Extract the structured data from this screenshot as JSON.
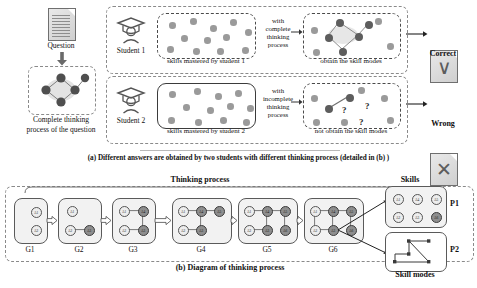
{
  "figure": {
    "caption_a": "(a) Different answers are obtained by two students with different thinking process (detailed in (b) )",
    "caption_b": "(b) Diagram of thinking process"
  },
  "panel_a": {
    "question_label": "Question",
    "question_icon": "document-icon",
    "arrow_icon": "down-arrow-icon",
    "complete_process_label_line1": "Complete thinking",
    "complete_process_label_line2": "process of the question",
    "rows": [
      {
        "student_label": "Student 1",
        "student_icon": "graduate-student-icon",
        "skills_label": "skills mastered by student 1",
        "connector_line1": "with",
        "connector_line2": "complete",
        "connector_line3": "thinking",
        "connector_line4": "process",
        "modes_label": "obtain the skill modes",
        "result_label": "Correct",
        "result_icon": "check-document-icon",
        "skill_dots": [
          {
            "x": 12,
            "y": 9,
            "state": "light"
          },
          {
            "x": 33,
            "y": 5,
            "state": "light"
          },
          {
            "x": 53,
            "y": 12,
            "state": "light"
          },
          {
            "x": 73,
            "y": 6,
            "state": "light"
          },
          {
            "x": 88,
            "y": 16,
            "state": "light"
          },
          {
            "x": 24,
            "y": 22,
            "state": "light"
          },
          {
            "x": 47,
            "y": 24,
            "state": "light"
          },
          {
            "x": 66,
            "y": 21,
            "state": "light"
          },
          {
            "x": 10,
            "y": 33,
            "state": "light"
          },
          {
            "x": 36,
            "y": 35,
            "state": "light"
          },
          {
            "x": 60,
            "y": 35,
            "state": "light"
          },
          {
            "x": 85,
            "y": 34,
            "state": "light"
          }
        ],
        "mode_dots": [
          {
            "x": 8,
            "y": 14,
            "state": "light"
          },
          {
            "x": 72,
            "y": 5,
            "state": "light"
          },
          {
            "x": 84,
            "y": 30,
            "state": "light"
          },
          {
            "x": 10,
            "y": 36,
            "state": "light"
          },
          {
            "x": 33,
            "y": 6,
            "state": "dark"
          },
          {
            "x": 22,
            "y": 21,
            "state": "dark"
          },
          {
            "x": 52,
            "y": 20,
            "state": "dark"
          },
          {
            "x": 36,
            "y": 35,
            "state": "dark"
          },
          {
            "x": 62,
            "y": 8,
            "state": "dark"
          }
        ]
      },
      {
        "student_label": "Student 2",
        "student_icon": "graduate-student-icon",
        "skills_label": "skills mastered by student 2",
        "connector_line1": "with",
        "connector_line2": "incomplete",
        "connector_line3": "thinking",
        "connector_line4": "process",
        "modes_label": "not obtain the skill modes",
        "result_label": "Wrong",
        "result_icon": "cross-document-icon",
        "skill_dots": [
          {
            "x": 12,
            "y": 8,
            "state": "light"
          },
          {
            "x": 37,
            "y": 5,
            "state": "light"
          },
          {
            "x": 58,
            "y": 10,
            "state": "light"
          },
          {
            "x": 78,
            "y": 7,
            "state": "light"
          },
          {
            "x": 90,
            "y": 22,
            "state": "light"
          },
          {
            "x": 26,
            "y": 21,
            "state": "light"
          },
          {
            "x": 50,
            "y": 24,
            "state": "light"
          },
          {
            "x": 70,
            "y": 20,
            "state": "light"
          },
          {
            "x": 11,
            "y": 34,
            "state": "light"
          },
          {
            "x": 38,
            "y": 36,
            "state": "light"
          },
          {
            "x": 63,
            "y": 34,
            "state": "light"
          },
          {
            "x": 86,
            "y": 36,
            "state": "light"
          }
        ],
        "mode_dots": [
          {
            "x": 8,
            "y": 12,
            "state": "light"
          },
          {
            "x": 55,
            "y": 4,
            "state": "light"
          },
          {
            "x": 78,
            "y": 12,
            "state": "light"
          },
          {
            "x": 10,
            "y": 36,
            "state": "light"
          },
          {
            "x": 38,
            "y": 36,
            "state": "light"
          },
          {
            "x": 84,
            "y": 34,
            "state": "light"
          },
          {
            "x": 22,
            "y": 22,
            "state": "dark"
          },
          {
            "x": 43,
            "y": 11,
            "state": "dark"
          }
        ],
        "question_marks": [
          {
            "x": 39,
            "y": 22
          },
          {
            "x": 62,
            "y": 18
          },
          {
            "x": 56,
            "y": 34
          }
        ]
      }
    ]
  },
  "panel_b": {
    "thinking_process_label": "Thinking process",
    "skills_label": "Skills",
    "skill_modes_label": "Skill modes",
    "p1_label": "P1",
    "p2_label": "P2",
    "arrow_icon": "right-arrow-icon",
    "stages": [
      {
        "label": "G1",
        "nodes": [
          {
            "id": "A1",
            "x": 17,
            "y": 9,
            "filled": false
          },
          {
            "id": "A2",
            "x": 17,
            "y": 27,
            "filled": false
          }
        ],
        "edges": []
      },
      {
        "label": "G2",
        "nodes": [
          {
            "id": "A1",
            "x": 9,
            "y": 8,
            "filled": false
          },
          {
            "id": "A2",
            "x": 7,
            "y": 27,
            "filled": false
          },
          {
            "id": "A3",
            "x": 26,
            "y": 27,
            "filled": true
          }
        ],
        "edges": [
          [
            1,
            2
          ]
        ]
      },
      {
        "label": "G3",
        "nodes": [
          {
            "id": "A1",
            "x": 7,
            "y": 8,
            "filled": false
          },
          {
            "id": "A4",
            "x": 26,
            "y": 8,
            "filled": true
          },
          {
            "id": "A2",
            "x": 7,
            "y": 27,
            "filled": false
          },
          {
            "id": "A3",
            "x": 26,
            "y": 27,
            "filled": true
          }
        ],
        "edges": [
          [
            0,
            1
          ],
          [
            2,
            3
          ],
          [
            1,
            3
          ]
        ]
      },
      {
        "label": "G4",
        "nodes": [
          {
            "id": "A1",
            "x": 6,
            "y": 8,
            "filled": false
          },
          {
            "id": "A4",
            "x": 24,
            "y": 8,
            "filled": true
          },
          {
            "id": "A5",
            "x": 42,
            "y": 8,
            "filled": true
          },
          {
            "id": "A2",
            "x": 6,
            "y": 27,
            "filled": false
          },
          {
            "id": "A3",
            "x": 24,
            "y": 27,
            "filled": true
          }
        ],
        "edges": [
          [
            0,
            1
          ],
          [
            1,
            2
          ],
          [
            3,
            4
          ],
          [
            1,
            4
          ]
        ]
      },
      {
        "label": "G5",
        "nodes": [
          {
            "id": "A1",
            "x": 6,
            "y": 8,
            "filled": false
          },
          {
            "id": "A4",
            "x": 24,
            "y": 8,
            "filled": true
          },
          {
            "id": "A5",
            "x": 42,
            "y": 8,
            "filled": true
          },
          {
            "id": "A2",
            "x": 6,
            "y": 27,
            "filled": false
          },
          {
            "id": "A3",
            "x": 24,
            "y": 27,
            "filled": true
          },
          {
            "id": "A6",
            "x": 42,
            "y": 27,
            "filled": true
          }
        ],
        "edges": [
          [
            0,
            1
          ],
          [
            1,
            2
          ],
          [
            3,
            4
          ],
          [
            1,
            4
          ],
          [
            2,
            5
          ]
        ]
      },
      {
        "label": "G6",
        "nodes": [
          {
            "id": "A1",
            "x": 6,
            "y": 8,
            "filled": false
          },
          {
            "id": "A4",
            "x": 24,
            "y": 8,
            "filled": true
          },
          {
            "id": "A5",
            "x": 42,
            "y": 8,
            "filled": true
          },
          {
            "id": "A2",
            "x": 6,
            "y": 27,
            "filled": false
          },
          {
            "id": "A3",
            "x": 24,
            "y": 27,
            "filled": true
          },
          {
            "id": "A6",
            "x": 42,
            "y": 27,
            "filled": true
          }
        ],
        "edges": [
          [
            0,
            1
          ],
          [
            1,
            2
          ],
          [
            3,
            4
          ],
          [
            1,
            4
          ],
          [
            2,
            5
          ],
          [
            0,
            3
          ]
        ]
      }
    ],
    "skills_nodes": [
      {
        "id": "A1",
        "x": 7,
        "y": 7,
        "filled": false
      },
      {
        "id": "A4",
        "x": 26,
        "y": 7,
        "filled": false
      },
      {
        "id": "A5",
        "x": 45,
        "y": 7,
        "filled": false
      },
      {
        "id": "A2",
        "x": 7,
        "y": 25,
        "filled": false
      },
      {
        "id": "A3",
        "x": 26,
        "y": 25,
        "filled": false
      },
      {
        "id": "A6",
        "x": 45,
        "y": 25,
        "filled": true
      }
    ]
  }
}
